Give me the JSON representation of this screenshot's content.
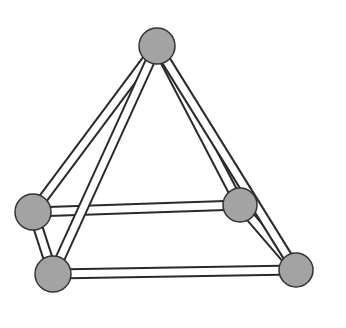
{
  "diagram": {
    "type": "ball-and-stick square pyramid",
    "colors": {
      "background": "#ffffff",
      "node_fill": "#a3a3a3",
      "node_stroke": "#333333",
      "rod_fill": "#ffffff",
      "rod_stroke": "#2a2a2a"
    },
    "rod_width": 9,
    "nodes": [
      {
        "id": "apex",
        "x": 157,
        "y": 46,
        "r": 18
      },
      {
        "id": "base-back-left",
        "x": 33,
        "y": 212,
        "r": 18
      },
      {
        "id": "base-back-right",
        "x": 240,
        "y": 205,
        "r": 17
      },
      {
        "id": "base-front-left",
        "x": 53,
        "y": 274,
        "r": 18
      },
      {
        "id": "base-front-right",
        "x": 296,
        "y": 270,
        "r": 17
      }
    ],
    "edges": [
      [
        "base-back-left",
        "base-back-right"
      ],
      [
        "base-back-right",
        "base-front-right"
      ],
      [
        "apex",
        "base-back-right"
      ],
      [
        "apex",
        "base-back-left"
      ],
      [
        "base-back-left",
        "base-front-left"
      ],
      [
        "base-front-left",
        "base-front-right"
      ],
      [
        "apex",
        "base-front-left"
      ],
      [
        "apex",
        "base-front-right"
      ]
    ]
  }
}
